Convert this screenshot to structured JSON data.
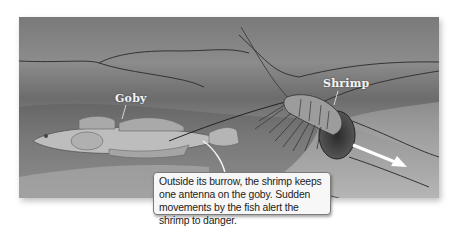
{
  "figure": {
    "labels": {
      "goby": "Goby",
      "shrimp": "Shrimp"
    },
    "caption": "Outside its burrow, the shrimp keeps one antenna on the goby. Sudden movements by the fish alert the shrimp to danger.",
    "arrow": {
      "meaning": "direction into burrow",
      "color": "#ffffff"
    },
    "colors": {
      "background": "#ffffff",
      "panel_tone": "#8a8a8a",
      "caption_bg": "#f7f7f7",
      "caption_border": "#7a7a7a",
      "label_text": "#f4f4f4"
    }
  }
}
